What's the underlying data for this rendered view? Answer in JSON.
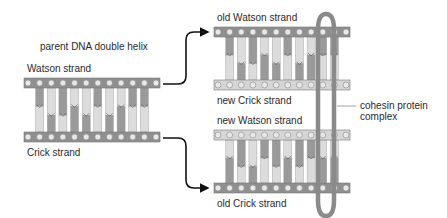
{
  "labels": {
    "parent_title": "parent DNA double helix",
    "parent_watson": "Watson strand",
    "parent_crick": "Crick strand",
    "old_watson": "old Watson strand",
    "new_crick": "new Crick strand",
    "new_watson": "new Watson strand",
    "old_crick": "old Crick strand",
    "cohesin_line1": "cohesin protein",
    "cohesin_line2": "complex"
  },
  "colors": {
    "old_strand": "#8f8f8f",
    "new_strand": "#d6d6d6",
    "dark_base": "#9a9a9a",
    "light_base": "#dcdcdc",
    "cohesin": "#8a8a8a",
    "text": "#2a2a2a"
  },
  "base_pairs": {
    "count": 10,
    "junction_levels": [
      "high",
      "low",
      "low",
      "high",
      "low",
      "high",
      "low",
      "high",
      "high",
      "high"
    ],
    "top_shade": [
      "dark",
      "light",
      "dark",
      "light",
      "light",
      "dark",
      "light",
      "light",
      "dark",
      "dark"
    ]
  }
}
